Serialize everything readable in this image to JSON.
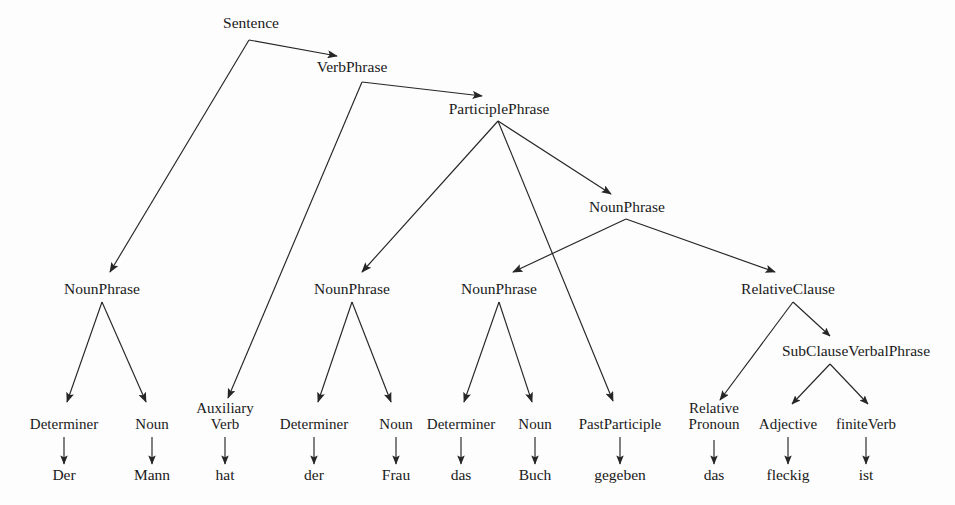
{
  "diagram": {
    "sentence": "Der Mann hat der Frau das Buch gegeben das fleckig ist",
    "colors": {
      "ink": "#1a1a1a",
      "edge": "#262626",
      "background": "#fdfdfd"
    },
    "arrow_style": "filled triangular arrowhead at child end"
  },
  "nodes": {
    "sentence": {
      "label": "Sentence",
      "x": 251,
      "y": 28
    },
    "verbphrase": {
      "label": "VerbPhrase",
      "x": 352,
      "y": 72
    },
    "participlephrase": {
      "label": "ParticiplePhrase",
      "x": 499,
      "y": 114
    },
    "nounphrase_obj": {
      "label": "NounPhrase",
      "x": 627,
      "y": 212
    },
    "nounphrase_1": {
      "label": "NounPhrase",
      "x": 102,
      "y": 294
    },
    "nounphrase_2": {
      "label": "NounPhrase",
      "x": 352,
      "y": 294
    },
    "nounphrase_3": {
      "label": "NounPhrase",
      "x": 499,
      "y": 294
    },
    "relativeclause": {
      "label": "RelativeClause",
      "x": 788,
      "y": 294
    },
    "subclauseverbalphrase": {
      "label": "SubClauseVerbalPhrase",
      "x": 856,
      "y": 356
    }
  },
  "pos_nodes": [
    {
      "id": "determiner-1",
      "label": "Determiner",
      "line2": "",
      "x": 64,
      "y": 429
    },
    {
      "id": "noun-1",
      "label": "Noun",
      "line2": "",
      "x": 152,
      "y": 429
    },
    {
      "id": "auxiliary-verb",
      "label": "Auxiliary",
      "line2": "Verb",
      "x": 225,
      "y": 429
    },
    {
      "id": "determiner-2",
      "label": "Determiner",
      "line2": "",
      "x": 314,
      "y": 429
    },
    {
      "id": "noun-2",
      "label": "Noun",
      "line2": "",
      "x": 396,
      "y": 429
    },
    {
      "id": "determiner-3",
      "label": "Determiner",
      "line2": "",
      "x": 461,
      "y": 429
    },
    {
      "id": "noun-3",
      "label": "Noun",
      "line2": "",
      "x": 535,
      "y": 429
    },
    {
      "id": "pastparticiple",
      "label": "PastParticiple",
      "line2": "",
      "x": 620,
      "y": 429
    },
    {
      "id": "relative-pronoun",
      "label": "Relative",
      "line2": "Pronoun",
      "x": 714,
      "y": 429
    },
    {
      "id": "adjective",
      "label": "Adjective",
      "line2": "",
      "x": 788,
      "y": 429
    },
    {
      "id": "finiteverb",
      "label": "finiteVerb",
      "line2": "",
      "x": 866,
      "y": 429
    }
  ],
  "words": [
    {
      "id": "word-der-1",
      "label": "Der",
      "x": 64,
      "y": 480
    },
    {
      "id": "word-mann",
      "label": "Mann",
      "x": 152,
      "y": 480
    },
    {
      "id": "word-hat",
      "label": "hat",
      "x": 225,
      "y": 480
    },
    {
      "id": "word-der-2",
      "label": "der",
      "x": 314,
      "y": 480
    },
    {
      "id": "word-frau",
      "label": "Frau",
      "x": 396,
      "y": 480
    },
    {
      "id": "word-das-1",
      "label": "das",
      "x": 461,
      "y": 480
    },
    {
      "id": "word-buch",
      "label": "Buch",
      "x": 535,
      "y": 480
    },
    {
      "id": "word-gegeben",
      "label": "gegeben",
      "x": 620,
      "y": 480
    },
    {
      "id": "word-das-2",
      "label": "das",
      "x": 714,
      "y": 480
    },
    {
      "id": "word-fleckig",
      "label": "fleckig",
      "x": 788,
      "y": 480
    },
    {
      "id": "word-ist",
      "label": "ist",
      "x": 866,
      "y": 480
    }
  ],
  "edges": [
    {
      "id": "edge-sentence-verbphrase",
      "from": "Sentence",
      "to": "VerbPhrase",
      "x1": 249,
      "y1": 40,
      "x2": 337,
      "y2": 56
    },
    {
      "id": "edge-sentence-nounphrase1",
      "from": "Sentence",
      "to": "NounPhrase",
      "x1": 249,
      "y1": 40,
      "x2": 110,
      "y2": 272
    },
    {
      "id": "edge-verbphrase-participlephrase",
      "from": "VerbPhrase",
      "to": "ParticiplePhrase",
      "x1": 362,
      "y1": 82,
      "x2": 482,
      "y2": 96
    },
    {
      "id": "edge-verbphrase-auxiliaryverb",
      "from": "VerbPhrase",
      "to": "AuxiliaryVerb",
      "x1": 362,
      "y1": 82,
      "x2": 228,
      "y2": 398
    },
    {
      "id": "edge-participlephrase-nounphrase2",
      "from": "ParticiplePhrase",
      "to": "NounPhrase",
      "x1": 498,
      "y1": 121,
      "x2": 362,
      "y2": 272
    },
    {
      "id": "edge-participlephrase-pastparticiple",
      "from": "ParticiplePhrase",
      "to": "PastParticiple",
      "x1": 498,
      "y1": 121,
      "x2": 613,
      "y2": 401
    },
    {
      "id": "edge-participlephrase-nounphraseobj",
      "from": "ParticiplePhrase",
      "to": "NounPhrase",
      "x1": 498,
      "y1": 121,
      "x2": 611,
      "y2": 194
    },
    {
      "id": "edge-nounphraseobj-nounphrase3",
      "from": "NounPhrase",
      "to": "NounPhrase",
      "x1": 626,
      "y1": 219,
      "x2": 513,
      "y2": 272
    },
    {
      "id": "edge-nounphraseobj-relativeclause",
      "from": "NounPhrase",
      "to": "RelativeClause",
      "x1": 626,
      "y1": 219,
      "x2": 775,
      "y2": 272
    },
    {
      "id": "edge-nounphrase1-determiner1",
      "from": "NounPhrase",
      "to": "Determiner",
      "x1": 102,
      "y1": 302,
      "x2": 67,
      "y2": 402
    },
    {
      "id": "edge-nounphrase1-noun1",
      "from": "NounPhrase",
      "to": "Noun",
      "x1": 102,
      "y1": 302,
      "x2": 146,
      "y2": 402
    },
    {
      "id": "edge-nounphrase2-determiner2",
      "from": "NounPhrase",
      "to": "Determiner",
      "x1": 352,
      "y1": 302,
      "x2": 318,
      "y2": 402
    },
    {
      "id": "edge-nounphrase2-noun2",
      "from": "NounPhrase",
      "to": "Noun",
      "x1": 352,
      "y1": 302,
      "x2": 391,
      "y2": 402
    },
    {
      "id": "edge-nounphrase3-determiner3",
      "from": "NounPhrase",
      "to": "Determiner",
      "x1": 499,
      "y1": 302,
      "x2": 464,
      "y2": 402
    },
    {
      "id": "edge-nounphrase3-noun3",
      "from": "NounPhrase",
      "to": "Noun",
      "x1": 499,
      "y1": 302,
      "x2": 532,
      "y2": 402
    },
    {
      "id": "edge-relativeclause-relativepronoun",
      "from": "RelativeClause",
      "to": "RelativePronoun",
      "x1": 793,
      "y1": 302,
      "x2": 720,
      "y2": 400
    },
    {
      "id": "edge-relativeclause-subclauseverbalphrase",
      "from": "RelativeClause",
      "to": "SubClauseVerbalPhrase",
      "x1": 793,
      "y1": 302,
      "x2": 830,
      "y2": 336
    },
    {
      "id": "edge-subclause-adjective",
      "from": "SubClauseVerbalPhrase",
      "to": "Adjective",
      "x1": 830,
      "y1": 364,
      "x2": 792,
      "y2": 404
    },
    {
      "id": "edge-subclause-finiteverb",
      "from": "SubClauseVerbalPhrase",
      "to": "finiteVerb",
      "x1": 830,
      "y1": 364,
      "x2": 868,
      "y2": 404
    },
    {
      "id": "edge-determiner1-der",
      "from": "Determiner",
      "to": "Der",
      "x1": 64,
      "y1": 437,
      "x2": 64,
      "y2": 464
    },
    {
      "id": "edge-noun1-mann",
      "from": "Noun",
      "to": "Mann",
      "x1": 152,
      "y1": 437,
      "x2": 152,
      "y2": 464
    },
    {
      "id": "edge-auxverb-hat",
      "from": "AuxiliaryVerb",
      "to": "hat",
      "x1": 225,
      "y1": 437,
      "x2": 225,
      "y2": 464
    },
    {
      "id": "edge-determiner2-der",
      "from": "Determiner",
      "to": "der",
      "x1": 314,
      "y1": 437,
      "x2": 314,
      "y2": 464
    },
    {
      "id": "edge-noun2-frau",
      "from": "Noun",
      "to": "Frau",
      "x1": 396,
      "y1": 437,
      "x2": 396,
      "y2": 464
    },
    {
      "id": "edge-determiner3-das",
      "from": "Determiner",
      "to": "das",
      "x1": 461,
      "y1": 437,
      "x2": 461,
      "y2": 464
    },
    {
      "id": "edge-noun3-buch",
      "from": "Noun",
      "to": "Buch",
      "x1": 535,
      "y1": 437,
      "x2": 535,
      "y2": 464
    },
    {
      "id": "edge-pastparticiple-gegeben",
      "from": "PastParticiple",
      "to": "gegeben",
      "x1": 620,
      "y1": 437,
      "x2": 620,
      "y2": 464
    },
    {
      "id": "edge-relpronoun-das",
      "from": "RelativePronoun",
      "to": "das",
      "x1": 714,
      "y1": 440,
      "x2": 714,
      "y2": 464
    },
    {
      "id": "edge-adjective-fleckig",
      "from": "Adjective",
      "to": "fleckig",
      "x1": 788,
      "y1": 437,
      "x2": 788,
      "y2": 464
    },
    {
      "id": "edge-finiteverb-ist",
      "from": "finiteVerb",
      "to": "ist",
      "x1": 866,
      "y1": 437,
      "x2": 866,
      "y2": 464
    }
  ]
}
